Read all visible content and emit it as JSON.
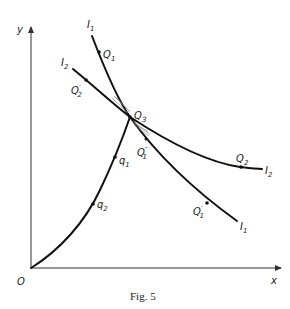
{
  "figure": {
    "caption": "Fig. 5",
    "axes": {
      "x_label": "x",
      "y_label": "y",
      "origin_label": "O"
    },
    "curves": [
      {
        "id": "I1",
        "label": "I",
        "subscript": "1",
        "type": "indifference-curve"
      },
      {
        "id": "I2",
        "label": "I",
        "subscript": "2",
        "type": "indifference-curve"
      },
      {
        "id": "path",
        "label": "",
        "type": "expansion-path",
        "from": "O",
        "to": "Q3"
      }
    ],
    "points": [
      {
        "id": "Q1",
        "label": "Q",
        "subscript": "1",
        "prime": "",
        "on": "I1"
      },
      {
        "id": "Q1pp",
        "label": "Q",
        "subscript": "1",
        "prime": "″",
        "on": "I1"
      },
      {
        "id": "Q1p",
        "label": "Q",
        "subscript": "1",
        "prime": "′",
        "on": "I1"
      },
      {
        "id": "Q2p",
        "label": "Q",
        "subscript": "2",
        "prime": "′",
        "on": "I2"
      },
      {
        "id": "Q2",
        "label": "Q",
        "subscript": "2",
        "prime": "",
        "on": "I2"
      },
      {
        "id": "Q3",
        "label": "Q",
        "subscript": "3",
        "prime": "",
        "on": "intersection"
      },
      {
        "id": "q1",
        "label": "q",
        "subscript": "1",
        "prime": "",
        "on": "path"
      },
      {
        "id": "q2",
        "label": "q",
        "subscript": "2",
        "prime": "",
        "on": "path"
      }
    ],
    "labels": {
      "I1_top": "I",
      "I1_top_sub": "1",
      "I1_end": "I",
      "I1_end_sub": "1",
      "I2_top": "I",
      "I2_top_sub": "2",
      "I2_end": "I",
      "I2_end_sub": "2",
      "Q1": "Q",
      "Q1_sub": "1",
      "Q1pp": "Q",
      "Q1pp_sub": "1",
      "Q1pp_prime": "″",
      "Q1p": "Q",
      "Q1p_sub": "1",
      "Q1p_prime": "′",
      "Q2p": "Q",
      "Q2p_sub": "2",
      "Q2p_prime": "′",
      "Q2": "Q",
      "Q2_sub": "2",
      "Q3": "Q",
      "Q3_sub": "3",
      "q1": "q",
      "q1_sub": "1",
      "q2": "q",
      "q2_sub": "2"
    }
  }
}
